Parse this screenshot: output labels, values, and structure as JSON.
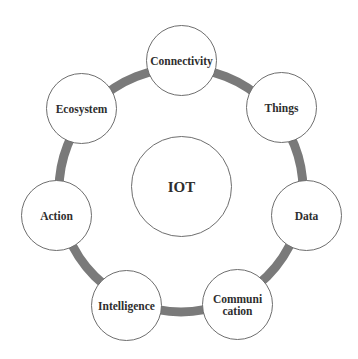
{
  "diagram": {
    "center": {
      "label": "IOT",
      "cx": 181,
      "cy": 186,
      "r": 50
    },
    "ring": {
      "cx": 181,
      "cy": 190,
      "r": 122,
      "stroke": "#7a7a7a",
      "width": 9
    },
    "nodes": [
      {
        "label": "Connectivity",
        "cx": 181,
        "cy": 60
      },
      {
        "label": "Things",
        "cx": 281,
        "cy": 107
      },
      {
        "label": "Data",
        "cx": 306,
        "cy": 215
      },
      {
        "label": "Communi\ncation",
        "cx": 237,
        "cy": 304
      },
      {
        "label": "Intelligence",
        "cx": 126,
        "cy": 305
      },
      {
        "label": "Action",
        "cx": 56,
        "cy": 215
      },
      {
        "label": "Ecosystem",
        "cx": 81,
        "cy": 108
      }
    ],
    "node_radius": 35
  }
}
